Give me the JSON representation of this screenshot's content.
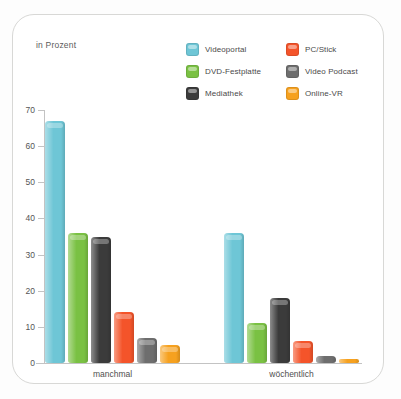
{
  "frame": {
    "present": true
  },
  "axis_note": "in Prozent",
  "legend": {
    "items": [
      {
        "label": "Videoportal",
        "color": "#6ec6d6",
        "key": "videoportal"
      },
      {
        "label": "PC/Stick",
        "color": "#f4542a",
        "key": "pc_stick"
      },
      {
        "label": "DVD-Festplatte",
        "color": "#7ac143",
        "key": "dvd_festplatte"
      },
      {
        "label": "Video Podcast",
        "color": "#6e6e6e",
        "key": "video_podcast"
      },
      {
        "label": "Mediathek",
        "color": "#3b3b3b",
        "key": "mediathek"
      },
      {
        "label": "Online-VR",
        "color": "#f6a11f",
        "key": "online_vr"
      }
    ]
  },
  "chart_data": {
    "type": "bar",
    "title": "",
    "subtitle": "",
    "xlabel": "",
    "ylabel": "in Prozent",
    "ylim": [
      0,
      70
    ],
    "yticks": [
      0,
      10,
      20,
      30,
      40,
      50,
      60,
      70
    ],
    "grid": false,
    "legend_position": "top-right",
    "categories": [
      "manchmal",
      "wöchentlich"
    ],
    "series": [
      {
        "name": "Videoportal",
        "color": "#6ec6d6",
        "values": [
          67,
          36
        ]
      },
      {
        "name": "DVD-Festplatte",
        "color": "#7ac143",
        "values": [
          36,
          11
        ]
      },
      {
        "name": "Mediathek",
        "color": "#3b3b3b",
        "values": [
          35,
          18
        ]
      },
      {
        "name": "PC/Stick",
        "color": "#f4542a",
        "values": [
          14,
          6
        ]
      },
      {
        "name": "Video Podcast",
        "color": "#6e6e6e",
        "values": [
          7,
          2
        ]
      },
      {
        "name": "Online-VR",
        "color": "#f6a11f",
        "values": [
          5,
          1
        ]
      }
    ]
  }
}
